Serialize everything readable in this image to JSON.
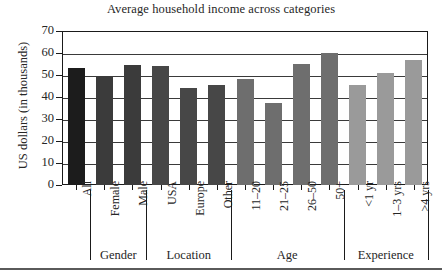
{
  "chart_data": {
    "type": "bar",
    "title": "Average household income across categories",
    "xlabel": "",
    "ylabel": "US dollars (in thousands)",
    "ylim": [
      0,
      70
    ],
    "ytick_values": [
      70,
      60,
      50,
      40,
      30,
      20,
      10,
      0
    ],
    "ytick_labels": [
      "70",
      "60",
      "50",
      "40",
      "30",
      "20",
      "10",
      "0"
    ],
    "grid": true,
    "legend": "none",
    "categories": [
      "All",
      "Female",
      "Male",
      "USA",
      "Europe",
      "Other",
      "11–20",
      "21–25",
      "26–50",
      "50+",
      "<1 yr",
      "1–3 yrs",
      ">4 yrs"
    ],
    "values": [
      53,
      49,
      54.5,
      54,
      44,
      45.5,
      48,
      37.5,
      55,
      60,
      45.5,
      51,
      57
    ],
    "bar_colors": [
      "#1c1c1c",
      "#3b3b3b",
      "#3b3b3b",
      "#474747",
      "#474747",
      "#474747",
      "#6e6e6e",
      "#6e6e6e",
      "#6e6e6e",
      "#6e6e6e",
      "#9a9a9a",
      "#9a9a9a",
      "#9a9a9a"
    ],
    "groups": [
      {
        "label": "",
        "categories": [
          "All"
        ]
      },
      {
        "label": "Gender",
        "categories": [
          "Female",
          "Male"
        ]
      },
      {
        "label": "Location",
        "categories": [
          "USA",
          "Europe",
          "Other"
        ]
      },
      {
        "label": "Age",
        "categories": [
          "11–20",
          "21–25",
          "26–50",
          "50+"
        ]
      },
      {
        "label": "Experience",
        "categories": [
          "<1 yr",
          "1–3 yrs",
          ">4 yrs"
        ]
      }
    ],
    "group_labels": [
      "Gender",
      "Location",
      "Age",
      "Experience"
    ]
  },
  "colors": {
    "axis": "#1a1a1a",
    "grid": "#3a3a3a",
    "text": "#262626",
    "background": "#ffffff",
    "rule": "#5a5a5a"
  }
}
